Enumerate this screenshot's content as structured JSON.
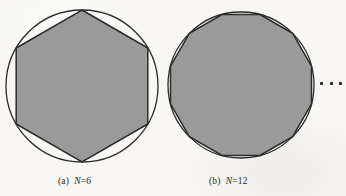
{
  "figure": {
    "background_color": "#f8f7f4",
    "fill_color": "#9a9a9a",
    "stroke_color": "#2b2b2b",
    "panels": [
      {
        "id": "a",
        "label_tag": "(a)",
        "variable": "N",
        "equals": "=",
        "value": "6",
        "shape": "hexagon",
        "sides": 6,
        "circle": {
          "cx": 82,
          "cy": 86,
          "r": 76
        },
        "polygon_rotation_deg": -90,
        "description": "regular hexagon inscribed in a circle"
      },
      {
        "id": "b",
        "label_tag": "(b)",
        "variable": "N",
        "equals": "=",
        "value": "12",
        "shape": "dodecagon",
        "sides": 12,
        "circle": {
          "cx": 241,
          "cy": 85,
          "r": 73
        },
        "polygon_rotation_deg": -75,
        "description": "regular 12-gon inscribed in a circle"
      }
    ],
    "continuation": {
      "symbol": "...",
      "dot_count": 3,
      "meaning": "sequence continues"
    }
  },
  "chart_data": {
    "type": "diagram",
    "title": "",
    "subtitle": "",
    "series": [
      {
        "name": "(a) N=6",
        "sides": 6,
        "inscribed_in_circle": true,
        "circle_radius_px": 76,
        "center_px": [
          82,
          86
        ]
      },
      {
        "name": "(b) N=12",
        "sides": 12,
        "inscribed_in_circle": true,
        "circle_radius_px": 73,
        "center_px": [
          241,
          85
        ]
      }
    ],
    "annotations": [
      "(a) N=6",
      "(b) N=12",
      "..."
    ],
    "legend": "none",
    "grid": false
  }
}
